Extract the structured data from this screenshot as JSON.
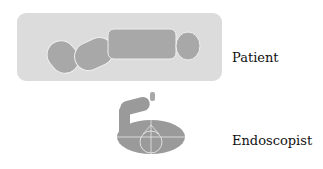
{
  "labels": {
    "patient": "Patient",
    "endoscopist": "Endoscopist"
  },
  "colors": {
    "bed": "#dcdcdc",
    "figure": "#a8a8a8",
    "outline": "#f2f2f2",
    "endoscopist": "#9a9a9a"
  }
}
